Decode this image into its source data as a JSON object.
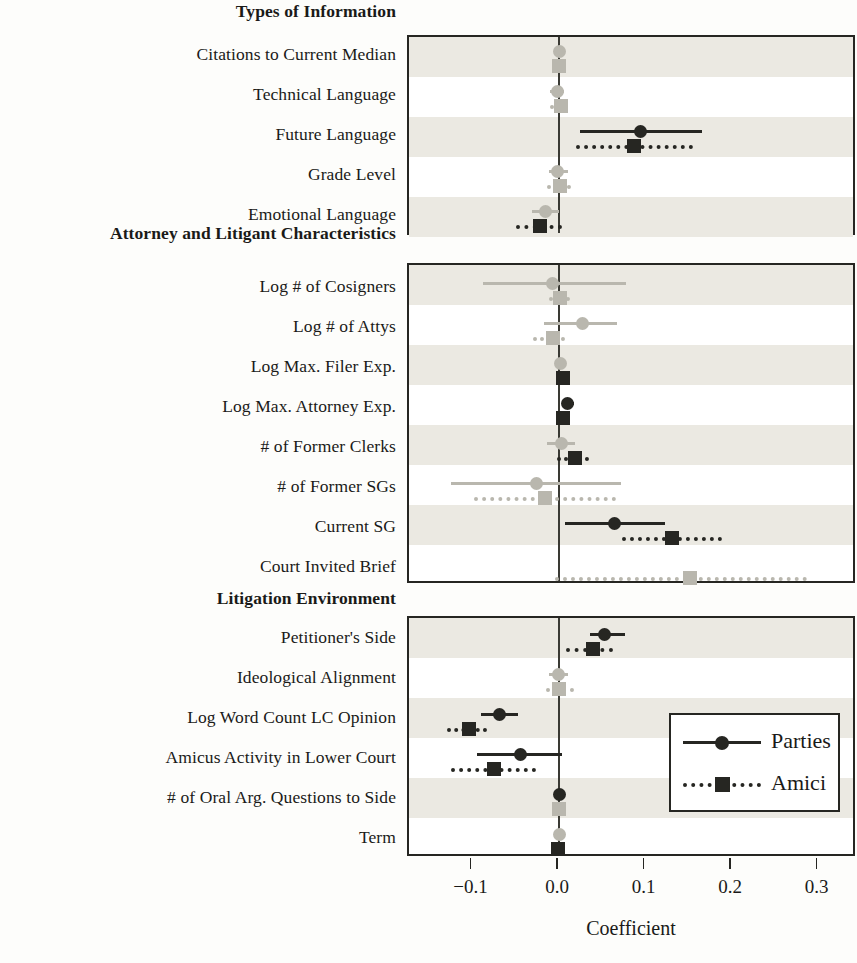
{
  "figure": {
    "axis_title": "Coefficient",
    "x_ticks": [
      "−0.1",
      "0.0",
      "0.1",
      "0.2",
      "0.3"
    ],
    "x_tick_values": [
      -0.1,
      0.0,
      0.1,
      0.2,
      0.3
    ],
    "legend": {
      "parties_label": "Parties",
      "amici_label": "Amici"
    }
  },
  "groups": [
    {
      "heading": "Types of Information",
      "rows": [
        "Citations to Current Median",
        "Technical Language",
        "Future Language",
        "Grade Level",
        "Emotional Language"
      ]
    },
    {
      "heading": "Attorney and Litigant Characteristics",
      "rows": [
        "Log # of Cosigners",
        "Log # of Attys",
        "Log Max. Filer Exp.",
        "Log Max. Attorney Exp.",
        "# of Former Clerks",
        "# of Former SGs",
        "Current SG",
        "Court Invited Brief"
      ]
    },
    {
      "heading": "Litigation Environment",
      "rows": [
        "Petitioner's Side",
        "Ideological Alignment",
        "Log Word Count LC Opinion",
        "Amicus Activity in Lower Court",
        "# of Oral Arg. Questions to Side",
        "Term"
      ]
    }
  ],
  "colors": {
    "significant": "#262622",
    "insignificant": "#b9b7ae",
    "band": "#ebe9e2",
    "panel_border": "#262622",
    "background": "#fdfdfb"
  },
  "chart_data": {
    "type": "scatter",
    "title": "",
    "xlabel": "Coefficient",
    "ylabel": "",
    "xlim": [
      -0.145,
      0.35
    ],
    "grid": false,
    "legend_position": "inside-bottom-right",
    "note": "Coefficient plot with 95% confidence intervals. Circles (solid lines) = Parties; squares (dotted lines) = Amici. Grey markers indicate intervals overlapping zero (statistically insignificant); black markers indicate significance.",
    "series": [
      {
        "name": "Parties",
        "marker": "circle",
        "line": "solid",
        "points": [
          {
            "label": "Citations to Current Median",
            "value": 0.0,
            "lo": -0.001,
            "hi": 0.001,
            "significant": false
          },
          {
            "label": "Technical Language",
            "value": -0.002,
            "lo": -0.01,
            "hi": 0.006,
            "significant": false
          },
          {
            "label": "Future Language",
            "value": 0.094,
            "lo": 0.024,
            "hi": 0.165,
            "significant": true
          },
          {
            "label": "Grade Level",
            "value": -0.002,
            "lo": -0.012,
            "hi": 0.01,
            "significant": false
          },
          {
            "label": "Emotional Language",
            "value": -0.016,
            "lo": -0.031,
            "hi": 0.0,
            "significant": false
          },
          {
            "label": "Log # of Cosigners",
            "value": -0.007,
            "lo": -0.088,
            "hi": 0.077,
            "significant": false
          },
          {
            "label": "Log # of Attys",
            "value": 0.027,
            "lo": -0.017,
            "hi": 0.067,
            "significant": false
          },
          {
            "label": "Log Max. Filer Exp.",
            "value": 0.002,
            "lo": -0.002,
            "hi": 0.006,
            "significant": false
          },
          {
            "label": "Log Max. Attorney Exp.",
            "value": 0.01,
            "lo": 0.003,
            "hi": 0.017,
            "significant": true
          },
          {
            "label": "# of Former Clerks",
            "value": 0.003,
            "lo": -0.014,
            "hi": 0.019,
            "significant": false
          },
          {
            "label": "# of Former SGs",
            "value": -0.026,
            "lo": -0.125,
            "hi": 0.072,
            "significant": false
          },
          {
            "label": "Current SG",
            "value": 0.064,
            "lo": 0.007,
            "hi": 0.123,
            "significant": true
          },
          {
            "label": "Court Invited Brief",
            "value": null,
            "lo": null,
            "hi": null,
            "significant": false
          },
          {
            "label": "Petitioner's Side",
            "value": 0.053,
            "lo": 0.036,
            "hi": 0.076,
            "significant": true
          },
          {
            "label": "Ideological Alignment",
            "value": -0.001,
            "lo": -0.012,
            "hi": 0.01,
            "significant": false
          },
          {
            "label": "Log Word Count LC Opinion",
            "value": -0.069,
            "lo": -0.09,
            "hi": -0.047,
            "significant": true
          },
          {
            "label": "Amicus Activity in Lower Court",
            "value": -0.045,
            "lo": -0.095,
            "hi": 0.003,
            "significant": true
          },
          {
            "label": "# of Oral Arg. Questions to Side",
            "value": 0.0,
            "lo": -0.001,
            "hi": 0.001,
            "significant": true
          },
          {
            "label": "Term",
            "value": 0.0,
            "lo": -0.001,
            "hi": 0.001,
            "significant": false
          }
        ]
      },
      {
        "name": "Amici",
        "marker": "square",
        "line": "dotted",
        "points": [
          {
            "label": "Citations to Current Median",
            "value": 0.0,
            "lo": -0.001,
            "hi": 0.001,
            "significant": false
          },
          {
            "label": "Technical Language",
            "value": 0.002,
            "lo": -0.01,
            "hi": 0.01,
            "significant": false
          },
          {
            "label": "Future Language",
            "value": 0.087,
            "lo": 0.02,
            "hi": 0.155,
            "significant": true
          },
          {
            "label": "Grade Level",
            "value": 0.001,
            "lo": -0.014,
            "hi": 0.014,
            "significant": false
          },
          {
            "label": "Emotional Language",
            "value": -0.022,
            "lo": -0.05,
            "hi": 0.003,
            "significant": true
          },
          {
            "label": "Log # of Cosigners",
            "value": 0.001,
            "lo": -0.012,
            "hi": 0.013,
            "significant": false
          },
          {
            "label": "Log # of Attys",
            "value": -0.007,
            "lo": -0.03,
            "hi": 0.007,
            "significant": false
          },
          {
            "label": "Log Max. Filer Exp.",
            "value": 0.005,
            "lo": 0.001,
            "hi": 0.01,
            "significant": true
          },
          {
            "label": "Log Max. Attorney Exp.",
            "value": 0.005,
            "lo": 0.0,
            "hi": 0.011,
            "significant": true
          },
          {
            "label": "# of Former Clerks",
            "value": 0.019,
            "lo": -0.002,
            "hi": 0.035,
            "significant": true
          },
          {
            "label": "# of Former SGs",
            "value": -0.016,
            "lo": -0.098,
            "hi": 0.066,
            "significant": false
          },
          {
            "label": "Current SG",
            "value": 0.131,
            "lo": 0.073,
            "hi": 0.188,
            "significant": true
          },
          {
            "label": "Court Invited Brief",
            "value": 0.152,
            "lo": -0.005,
            "hi": 0.287,
            "significant": false
          },
          {
            "label": "Petitioner's Side",
            "value": 0.039,
            "lo": 0.008,
            "hi": 0.062,
            "significant": true
          },
          {
            "label": "Ideological Alignment",
            "value": 0.0,
            "lo": -0.015,
            "hi": 0.017,
            "significant": false
          },
          {
            "label": "Log Word Count LC Opinion",
            "value": -0.104,
            "lo": -0.13,
            "hi": -0.083,
            "significant": true
          },
          {
            "label": "Amicus Activity in Lower Court",
            "value": -0.075,
            "lo": -0.125,
            "hi": -0.027,
            "significant": true
          },
          {
            "label": "# of Oral Arg. Questions to Side",
            "value": 0.0,
            "lo": -0.001,
            "hi": 0.001,
            "significant": false
          },
          {
            "label": "Term",
            "value": -0.001,
            "lo": -0.002,
            "hi": 0.001,
            "significant": true
          }
        ]
      }
    ]
  }
}
